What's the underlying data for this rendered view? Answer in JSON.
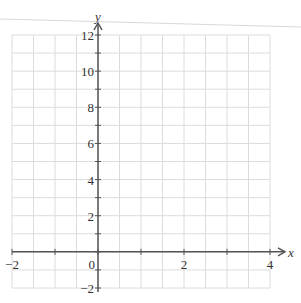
{
  "chart_data": {
    "type": "line",
    "title": "",
    "xlabel": "x",
    "ylabel": "y",
    "xlim": [
      -2,
      4
    ],
    "ylim": [
      -2,
      12
    ],
    "x_ticks": [
      -2,
      -1,
      0,
      1,
      2,
      3,
      4
    ],
    "x_tick_labels": [
      {
        "value": -2,
        "label": "−2"
      },
      {
        "value": 0,
        "label": "0"
      },
      {
        "value": 2,
        "label": "2"
      },
      {
        "value": 4,
        "label": "4"
      }
    ],
    "y_ticks": [
      -2,
      -1,
      0,
      1,
      2,
      3,
      4,
      5,
      6,
      7,
      8,
      9,
      10,
      11,
      12
    ],
    "y_tick_labels": [
      {
        "value": -2,
        "label": "−2"
      },
      {
        "value": 2,
        "label": "2"
      },
      {
        "value": 4,
        "label": "4"
      },
      {
        "value": 6,
        "label": "6"
      },
      {
        "value": 8,
        "label": "8"
      },
      {
        "value": 10,
        "label": "10"
      },
      {
        "value": 12,
        "label": "12"
      }
    ],
    "grid": true,
    "grid_x_step": 0.5,
    "grid_y_step": 1,
    "series": [],
    "legend": null
  },
  "colors": {
    "grid": "#dcdcdc",
    "axis": "#555555",
    "text": "#333333",
    "stray_line": "#d8d8d8"
  }
}
